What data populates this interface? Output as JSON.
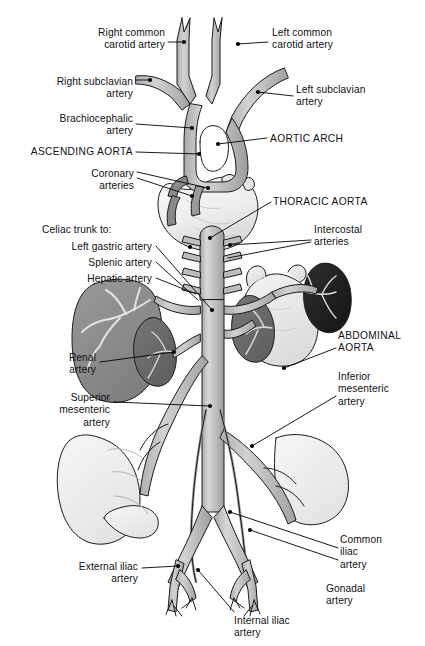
{
  "figure": {
    "background_color": "#ffffff",
    "vessel_fill": "#b9b9b9",
    "vessel_stroke": "#1a1a1a",
    "liver_color": "#8e8e8e",
    "kidney_color": "#6a6a6a",
    "spleen_color": "#262626",
    "stomach_color": "#e8e8e8",
    "heart_color": "#f2f2f2",
    "intestine_color": "#efefef",
    "leader_color": "#000000"
  },
  "labels": [
    {
      "id": "right-common-carotid-artery",
      "text": "Right common\ncarotid artery",
      "align": "right",
      "x": 60,
      "y": 27,
      "width": 105
    },
    {
      "id": "left-common-carotid-artery",
      "text": "Left common\ncarotid artery",
      "align": "left",
      "x": 272,
      "y": 27,
      "width": 120
    },
    {
      "id": "right-subclavian-artery",
      "text": "Right subclavian\nartery",
      "align": "right",
      "x": 18,
      "y": 76,
      "width": 115
    },
    {
      "id": "left-subclavian-artery",
      "text": "Left subclavian\nartery",
      "align": "left",
      "x": 296,
      "y": 84,
      "width": 120
    },
    {
      "id": "brachiocephalic-artery",
      "text": "Brachiocephalic\nartery",
      "align": "right",
      "x": 28,
      "y": 113,
      "width": 105
    },
    {
      "id": "ascending-aorta",
      "text": "ASCENDING AORTA",
      "align": "right",
      "x": 10,
      "y": 146,
      "width": 123,
      "caps": true
    },
    {
      "id": "aortic-arch",
      "text": "AORTIC ARCH",
      "align": "left",
      "x": 270,
      "y": 133,
      "width": 110,
      "caps": true
    },
    {
      "id": "coronary-arteries",
      "text": "Coronary\narteries",
      "align": "right",
      "x": 62,
      "y": 168,
      "width": 72
    },
    {
      "id": "thoracic-aorta",
      "text": "THORACIC AORTA",
      "align": "left",
      "x": 273,
      "y": 196,
      "width": 118,
      "caps": true
    },
    {
      "id": "celiac-trunk-to",
      "text": "Celiac trunk to:",
      "align": "left",
      "x": 42,
      "y": 224,
      "width": 110
    },
    {
      "id": "intercostal-arteries",
      "text": "Intercostal\narteries",
      "align": "left",
      "x": 314,
      "y": 224,
      "width": 90
    },
    {
      "id": "left-gastric-artery",
      "text": "Left gastric artery",
      "align": "right",
      "x": 28,
      "y": 241,
      "width": 124
    },
    {
      "id": "splenic-artery",
      "text": "Splenic artery",
      "align": "right",
      "x": 28,
      "y": 257,
      "width": 124
    },
    {
      "id": "hepatic-artery",
      "text": "Hepatic artery",
      "align": "right",
      "x": 28,
      "y": 273,
      "width": 124
    },
    {
      "id": "abdominal-aorta",
      "text": "ABDOMINAL\nAORTA",
      "align": "left",
      "x": 338,
      "y": 330,
      "width": 86,
      "caps": true
    },
    {
      "id": "renal-artery",
      "text": "Renal\nartery",
      "align": "right",
      "x": 40,
      "y": 352,
      "width": 56
    },
    {
      "id": "inferior-mesenteric-artery",
      "text": "Inferior\nmesenteric\nartery",
      "align": "left",
      "x": 338,
      "y": 371,
      "width": 84
    },
    {
      "id": "superior-mesenteric-artery",
      "text": "Superior\nmesenteric\nartery",
      "align": "right",
      "x": 32,
      "y": 392,
      "width": 78
    },
    {
      "id": "common-iliac-artery",
      "text": "Common\niliac\nartery",
      "align": "left",
      "x": 340,
      "y": 534,
      "width": 72
    },
    {
      "id": "external-iliac-artery",
      "text": "External iliac\nartery",
      "align": "right",
      "x": 48,
      "y": 561,
      "width": 90
    },
    {
      "id": "gonadal-artery",
      "text": "Gonadal\nartery",
      "align": "left",
      "x": 326,
      "y": 583,
      "width": 74
    },
    {
      "id": "internal-iliac-artery",
      "text": "Internal iliac\nartery",
      "align": "left",
      "x": 234,
      "y": 615,
      "width": 92
    }
  ],
  "structures": [
    {
      "id": "right-common-carotid-artery",
      "kind": "vessel"
    },
    {
      "id": "left-common-carotid-artery",
      "kind": "vessel"
    },
    {
      "id": "right-subclavian-artery",
      "kind": "vessel"
    },
    {
      "id": "left-subclavian-artery",
      "kind": "vessel"
    },
    {
      "id": "brachiocephalic-artery",
      "kind": "vessel"
    },
    {
      "id": "ascending-aorta",
      "kind": "vessel"
    },
    {
      "id": "aortic-arch",
      "kind": "vessel"
    },
    {
      "id": "coronary-arteries",
      "kind": "vessel"
    },
    {
      "id": "thoracic-aorta",
      "kind": "vessel"
    },
    {
      "id": "intercostal-arteries",
      "kind": "vessel"
    },
    {
      "id": "celiac-trunk",
      "kind": "vessel"
    },
    {
      "id": "abdominal-aorta",
      "kind": "vessel"
    },
    {
      "id": "renal-artery",
      "kind": "vessel"
    },
    {
      "id": "superior-mesenteric-artery",
      "kind": "vessel"
    },
    {
      "id": "inferior-mesenteric-artery",
      "kind": "vessel"
    },
    {
      "id": "gonadal-artery",
      "kind": "vessel"
    },
    {
      "id": "common-iliac-artery",
      "kind": "vessel"
    },
    {
      "id": "external-iliac-artery",
      "kind": "vessel"
    },
    {
      "id": "internal-iliac-artery",
      "kind": "vessel"
    },
    {
      "id": "heart",
      "kind": "organ"
    },
    {
      "id": "liver",
      "kind": "organ"
    },
    {
      "id": "right-kidney",
      "kind": "organ"
    },
    {
      "id": "left-kidney",
      "kind": "organ"
    },
    {
      "id": "stomach",
      "kind": "organ"
    },
    {
      "id": "spleen",
      "kind": "organ"
    },
    {
      "id": "small-intestine",
      "kind": "organ"
    },
    {
      "id": "large-intestine",
      "kind": "organ"
    }
  ]
}
